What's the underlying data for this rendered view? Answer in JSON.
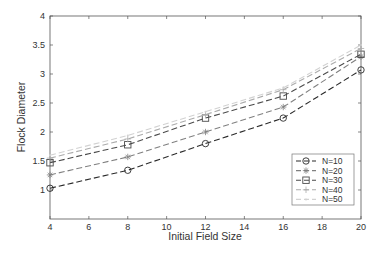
{
  "chart_data": {
    "type": "line",
    "title": "",
    "xlabel": "Initial Field Size",
    "ylabel": "Flock Diameter",
    "x": [
      4,
      8,
      12,
      16,
      20
    ],
    "xticks": [
      4,
      6,
      8,
      10,
      12,
      14,
      16,
      18,
      20
    ],
    "yticks": [
      1,
      1.5,
      2,
      2.5,
      3,
      3.5,
      4
    ],
    "xlim": [
      4,
      20
    ],
    "ylim": [
      0.5,
      4
    ],
    "grid": false,
    "legend_position": "lower right",
    "series": [
      {
        "name": "N=10",
        "marker": "circle",
        "color": "#2a2a2a",
        "values": [
          1.03,
          1.34,
          1.8,
          2.24,
          3.07
        ]
      },
      {
        "name": "N=20",
        "marker": "star",
        "color": "#808080",
        "values": [
          1.26,
          1.57,
          2.0,
          2.43,
          3.3
        ]
      },
      {
        "name": "N=30",
        "marker": "square",
        "color": "#4a4a4a",
        "values": [
          1.47,
          1.78,
          2.24,
          2.62,
          3.34
        ]
      },
      {
        "name": "N=40",
        "marker": "plus",
        "color": "#ababab",
        "values": [
          1.55,
          1.88,
          2.3,
          2.73,
          3.44
        ]
      },
      {
        "name": "N=50",
        "marker": "point",
        "color": "#d2d2d2",
        "values": [
          1.6,
          1.94,
          2.35,
          2.76,
          3.5
        ]
      }
    ]
  }
}
